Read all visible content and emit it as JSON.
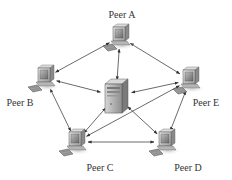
{
  "diagram": {
    "type": "peer-to-peer network with central server",
    "background": "#ffffff",
    "line_color": "#444444",
    "server": {
      "id": "server",
      "label": "",
      "x": 116,
      "y": 96
    },
    "peers": [
      {
        "id": "peer-a",
        "label": "Peer A",
        "x": 120,
        "y": 37,
        "label_x": 122,
        "label_y": 10
      },
      {
        "id": "peer-b",
        "label": "Peer B",
        "x": 45,
        "y": 78,
        "label_x": 20,
        "label_y": 98
      },
      {
        "id": "peer-e",
        "label": "Peer E",
        "x": 190,
        "y": 80,
        "label_x": 206,
        "label_y": 98
      },
      {
        "id": "peer-c",
        "label": "Peer C",
        "x": 76,
        "y": 142,
        "label_x": 100,
        "label_y": 163
      },
      {
        "id": "peer-d",
        "label": "Peer D",
        "x": 166,
        "y": 142,
        "label_x": 188,
        "label_y": 163
      }
    ],
    "connections": [
      {
        "from": "peer-a",
        "to": "peer-b"
      },
      {
        "from": "peer-a",
        "to": "peer-e"
      },
      {
        "from": "peer-a",
        "to": "server"
      },
      {
        "from": "peer-b",
        "to": "server"
      },
      {
        "from": "peer-e",
        "to": "server"
      },
      {
        "from": "peer-b",
        "to": "peer-c"
      },
      {
        "from": "peer-e",
        "to": "peer-d"
      },
      {
        "from": "peer-c",
        "to": "peer-d"
      },
      {
        "from": "peer-c",
        "to": "server"
      },
      {
        "from": "peer-d",
        "to": "server"
      },
      {
        "from": "peer-c",
        "to": "peer-e"
      }
    ]
  }
}
